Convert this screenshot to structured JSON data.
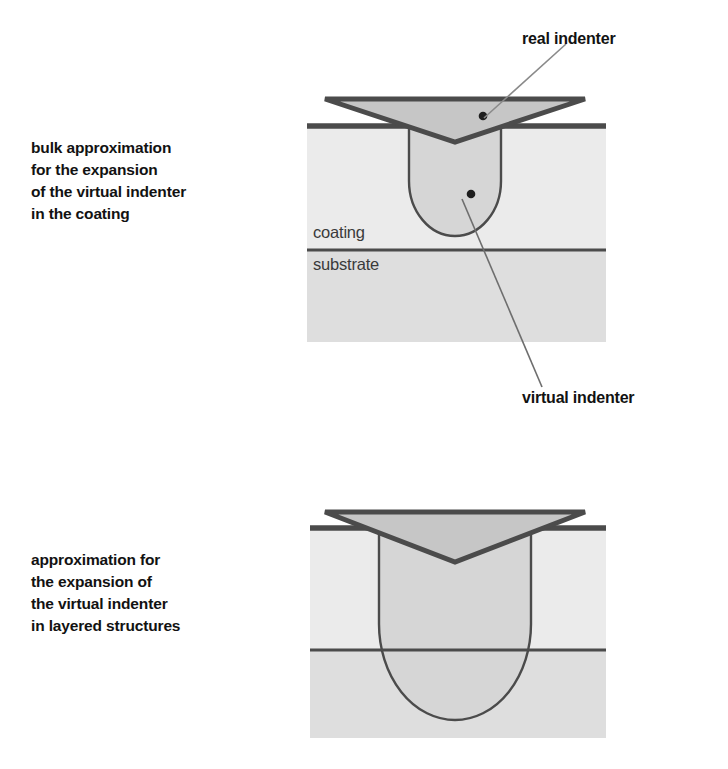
{
  "figure": {
    "background_color": "#ffffff",
    "text_color": "#121212"
  },
  "captions": {
    "top": "bulk approximation\nfor the expansion\nof the virtual indenter\nin the coating",
    "bottom": "approximation for\nthe expansion of\nthe virtual indenter\nin layered structures"
  },
  "callouts": {
    "real_indenter": "real indenter",
    "virtual_indenter": "virtual indenter"
  },
  "materials": {
    "coating_label": "coating",
    "substrate_label": "substrate"
  },
  "colors": {
    "coating_fill": "#ebebeb",
    "substrate_fill": "#dedede",
    "indenter_fill": "#c6c6c6",
    "zone_fill": "#d6d6d6",
    "outline_dark": "#4b4b4b",
    "outline_line": "#555555",
    "leader_line": "#7a7a7a"
  },
  "panels": {
    "top": {
      "name": "bulk-approximation-panel",
      "specimen": {
        "x": 0,
        "y": 42,
        "width": 300,
        "height": 216
      },
      "interface_y": 166,
      "surface_y": 42,
      "indenter": {
        "tip_x": 159,
        "tip_y": 58,
        "top_y": 15,
        "half_width": 130
      },
      "zone": {
        "cx": 159,
        "cy": 97,
        "rx": 46,
        "ry": 55
      },
      "marker_points": [
        {
          "name": "real-indenter-marker",
          "x": 187,
          "y": 32
        },
        {
          "name": "virtual-indenter-marker",
          "x": 175,
          "y": 110
        }
      ]
    },
    "bottom": {
      "name": "layered-structure-panel",
      "specimen": {
        "x": 0,
        "y": 34,
        "width": 300,
        "height": 210
      },
      "interface_y": 156,
      "surface_y": 34,
      "indenter": {
        "tip_x": 159,
        "tip_y": 68,
        "top_y": 18,
        "half_width": 130
      },
      "zone": {
        "cx": 159,
        "cy": 130,
        "rx": 76,
        "ry": 96
      },
      "marker_points": []
    }
  }
}
